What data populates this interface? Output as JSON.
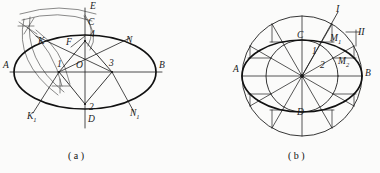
{
  "figure": {
    "background_color": "#fbfbfa",
    "ink_color": "#1a1a1a",
    "width": 380,
    "height": 173
  },
  "captions": [
    {
      "id": "caption-a",
      "text": "( a )",
      "x": 68,
      "y": 152
    },
    {
      "id": "caption-b",
      "text": "( b )",
      "x": 288,
      "y": 152
    }
  ],
  "diagram_a": {
    "name": "four-centre-arc-ellipse-construction",
    "center": {
      "x": 85,
      "y": 72,
      "label": "O"
    },
    "ellipse": {
      "rx": 71,
      "ry": 37
    },
    "axis_labels": [
      {
        "id": "point-A",
        "text": "A",
        "x": 3,
        "y": 66
      },
      {
        "id": "point-B",
        "text": "B",
        "x": 159,
        "y": 66
      },
      {
        "id": "point-C",
        "text": "C",
        "x": 88,
        "y": 23
      },
      {
        "id": "point-D",
        "text": "D",
        "x": 88,
        "y": 120
      },
      {
        "id": "point-E",
        "text": "E",
        "x": 90,
        "y": 5
      },
      {
        "id": "point-O",
        "text": "O",
        "x": 76,
        "y": 66
      },
      {
        "id": "point-F",
        "text": "F",
        "x": 66,
        "y": 43
      },
      {
        "id": "point-K",
        "text": "K",
        "x": 38,
        "y": 42
      },
      {
        "id": "point-K1",
        "text": "K",
        "sub": "1",
        "x": 27,
        "y": 117
      },
      {
        "id": "point-N",
        "text": "N",
        "x": 126,
        "y": 41
      },
      {
        "id": "point-N1",
        "text": "N",
        "sub": "1",
        "x": 130,
        "y": 114
      },
      {
        "id": "point-1",
        "text": "1",
        "x": 57,
        "y": 65
      },
      {
        "id": "point-2",
        "text": "2",
        "x": 89,
        "y": 108
      },
      {
        "id": "point-3",
        "text": "3",
        "x": 109,
        "y": 64
      },
      {
        "id": "point-4",
        "text": "4",
        "x": 90,
        "y": 35
      }
    ]
  },
  "diagram_b": {
    "name": "concentric-circles-ellipse-construction",
    "center": {
      "x": 302,
      "y": 76
    },
    "outer_circle_r": 60,
    "inner_circle_r": 36,
    "ellipse": {
      "rx": 60,
      "ry": 36
    },
    "spoke_count": 12,
    "spoke_step_degrees": 30,
    "axis_labels": [
      {
        "id": "point-A",
        "text": "A",
        "x": 233,
        "y": 70
      },
      {
        "id": "point-B",
        "text": "B",
        "x": 365,
        "y": 74
      },
      {
        "id": "point-C",
        "text": "C",
        "x": 297,
        "y": 36
      },
      {
        "id": "point-D",
        "text": "D",
        "x": 297,
        "y": 113
      },
      {
        "id": "point-M1",
        "text": "M",
        "sub": "1",
        "x": 330,
        "y": 39
      },
      {
        "id": "point-M2",
        "text": "M",
        "sub": "2",
        "x": 338,
        "y": 62
      },
      {
        "id": "point-1",
        "text": "1",
        "x": 312,
        "y": 52
      },
      {
        "id": "point-2",
        "text": "2",
        "x": 320,
        "y": 66
      },
      {
        "id": "roman-I",
        "text": "I",
        "x": 336,
        "y": 8
      },
      {
        "id": "roman-II",
        "text": "II",
        "x": 358,
        "y": 32
      }
    ]
  }
}
